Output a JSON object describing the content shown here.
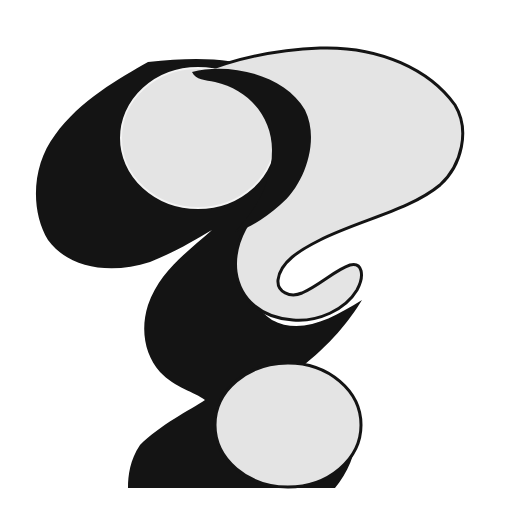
{
  "image": {
    "subject": "Stylized question mark illustration",
    "alt": "Black and light gray abstract question mark with three rounded lobes",
    "colors": {
      "background": "#ffffff",
      "ink": "#141414",
      "fill": "#e4e4e4"
    }
  }
}
